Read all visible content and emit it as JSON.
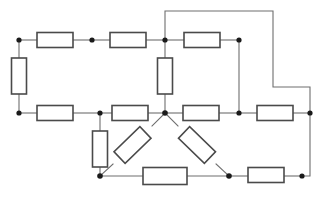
{
  "figure": {
    "name": "resistor-network-schematic",
    "type": "electrical-circuit-diagram",
    "width": 323,
    "height": 206,
    "background_color": "#ffffff",
    "wire_color": "#6e6e6e",
    "resistor_outline_color": "#4a4a4a",
    "resistor_fill_color": "#ffffff",
    "node_color": "#1a1a1a",
    "node_radius": 2.6,
    "wire_width": 1.1,
    "resistor_stroke_width": 1.6,
    "resistor_length": 36,
    "resistor_width": 15,
    "component_count": 16,
    "node_count": 13
  },
  "nodes": [
    {
      "id": "n-top-left",
      "label": "",
      "x": 19,
      "y": 40,
      "dot": true
    },
    {
      "id": "n-top-mid",
      "label": "",
      "x": 92,
      "y": 40,
      "dot": true
    },
    {
      "id": "n-top-center",
      "label": "",
      "x": 165,
      "y": 40,
      "dot": true
    },
    {
      "id": "n-top-right",
      "label": "",
      "x": 239,
      "y": 40,
      "dot": true
    },
    {
      "id": "n-mid-left",
      "label": "",
      "x": 19,
      "y": 113,
      "dot": true
    },
    {
      "id": "n-mid-leftcenter",
      "label": "",
      "x": 100,
      "y": 113,
      "dot": true
    },
    {
      "id": "n-center",
      "label": "",
      "x": 165,
      "y": 113,
      "dot": true
    },
    {
      "id": "n-mid-right",
      "label": "",
      "x": 239,
      "y": 113,
      "dot": true
    },
    {
      "id": "n-mid-far-right",
      "label": "",
      "x": 310,
      "y": 113,
      "dot": true
    },
    {
      "id": "n-bot-left",
      "label": "",
      "x": 100,
      "y": 176,
      "dot": true
    },
    {
      "id": "n-bot-right",
      "label": "",
      "x": 229,
      "y": 176,
      "dot": true
    },
    {
      "id": "n-bot-far-right",
      "label": "",
      "x": 302,
      "y": 176,
      "dot": true
    },
    {
      "id": "n-bot-corner",
      "label": "",
      "x": 310,
      "y": 176,
      "dot": false
    }
  ],
  "resistors": [
    {
      "id": "r-top-1",
      "label": "",
      "x1": 19,
      "y1": 40,
      "x2": 92,
      "y2": 40,
      "orientation": "horizontal"
    },
    {
      "id": "r-top-2",
      "label": "",
      "x1": 92,
      "y1": 40,
      "x2": 165,
      "y2": 40,
      "orientation": "horizontal"
    },
    {
      "id": "r-top-3",
      "label": "",
      "x1": 165,
      "y1": 40,
      "x2": 239,
      "y2": 40,
      "orientation": "horizontal"
    },
    {
      "id": "r-left-vert",
      "label": "",
      "x1": 19,
      "y1": 40,
      "x2": 19,
      "y2": 113,
      "orientation": "vertical"
    },
    {
      "id": "r-center-vert",
      "label": "",
      "x1": 165,
      "y1": 40,
      "x2": 165,
      "y2": 113,
      "orientation": "vertical"
    },
    {
      "id": "r-mid-1",
      "label": "",
      "x1": 19,
      "y1": 113,
      "x2": 100,
      "y2": 113,
      "orientation": "horizontal"
    },
    {
      "id": "r-mid-2",
      "label": "",
      "x1": 100,
      "y1": 113,
      "x2": 165,
      "y2": 113,
      "orientation": "horizontal"
    },
    {
      "id": "r-mid-3",
      "label": "",
      "x1": 165,
      "y1": 113,
      "x2": 239,
      "y2": 113,
      "orientation": "horizontal"
    },
    {
      "id": "r-mid-4",
      "label": "",
      "x1": 239,
      "y1": 113,
      "x2": 310,
      "y2": 113,
      "orientation": "horizontal"
    },
    {
      "id": "r-lower-vert",
      "label": "",
      "x1": 100,
      "y1": 113,
      "x2": 100,
      "y2": 176,
      "orientation": "vertical"
    },
    {
      "id": "r-diag-left",
      "label": "",
      "x1": 165,
      "y1": 113,
      "x2": 100,
      "y2": 176,
      "orientation": "diagonal"
    },
    {
      "id": "r-diag-right",
      "label": "",
      "x1": 165,
      "y1": 113,
      "x2": 229,
      "y2": 176,
      "orientation": "diagonal"
    },
    {
      "id": "r-bot-1",
      "label": "",
      "x1": 100,
      "y1": 176,
      "x2": 229,
      "y2": 176,
      "orientation": "horizontal"
    },
    {
      "id": "r-bot-2",
      "label": "",
      "x1": 229,
      "y1": 176,
      "x2": 302,
      "y2": 176,
      "orientation": "horizontal"
    }
  ],
  "wires": [
    {
      "id": "w-top-loop",
      "points": "165,40 165,11 273,11 273,87 310,87 310,113"
    },
    {
      "id": "w-topright-down",
      "points": "239,40 239,113"
    },
    {
      "id": "w-right-down",
      "points": "310,113 310,176 302,176"
    }
  ]
}
